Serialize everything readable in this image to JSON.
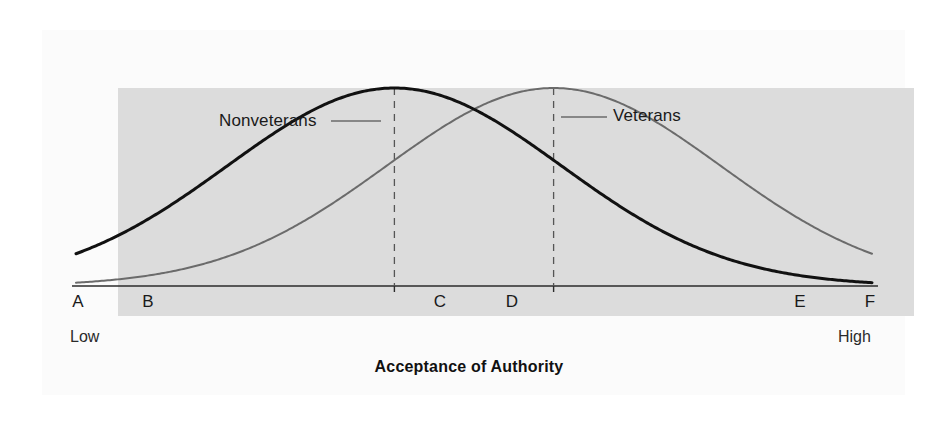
{
  "figure": {
    "axis_title": "Acceptance of Authority",
    "low_label": "Low",
    "high_label": "High",
    "background_color": "#fbfbfb",
    "plot_background_color": "#dcdcdc"
  },
  "labels": {
    "nonveterans": "Nonveterans",
    "veterans": "Veterans"
  },
  "ticks": {
    "a": "A",
    "b": "B",
    "c": "C",
    "d": "D",
    "e": "E",
    "f": "F"
  },
  "chart_data": {
    "type": "line",
    "title": "",
    "xlabel": "Acceptance of Authority",
    "ylabel": "",
    "grid": false,
    "legend_position": "inline-annotation",
    "x_tick_labels": [
      "A",
      "B",
      "C",
      "D",
      "E",
      "F"
    ],
    "x_tick_positions": [
      0,
      1,
      2,
      3,
      4,
      5
    ],
    "x_axis_low_end_label": "Low",
    "x_axis_high_end_label": "High",
    "annotations": [
      {
        "text": "Nonveterans",
        "points_to_series": "Nonveterans"
      },
      {
        "text": "Veterans",
        "points_to_series": "Veterans"
      },
      {
        "type": "dashed-vertical-line",
        "at_tick": "C",
        "marks": "peak of Nonveterans"
      },
      {
        "type": "dashed-vertical-line",
        "at_tick": "D",
        "marks": "peak of Veterans"
      }
    ],
    "series": [
      {
        "name": "Nonveterans",
        "color": "#111111",
        "line_width": 3,
        "distribution": "normal",
        "peak_tick": "C",
        "peak_x": 2.0,
        "sigma_in_ticks": 1.05,
        "peak_height_relative": 1.0,
        "x": [
          0,
          0.5,
          1,
          1.5,
          2,
          2.5,
          3,
          3.5,
          4,
          4.5,
          5
        ],
        "values": [
          0.14,
          0.32,
          0.57,
          0.85,
          1.0,
          0.85,
          0.57,
          0.32,
          0.14,
          0.05,
          0.01
        ]
      },
      {
        "name": "Veterans",
        "color": "#6b6b6b",
        "line_width": 2,
        "distribution": "normal",
        "peak_tick": "D",
        "peak_x": 3.0,
        "sigma_in_ticks": 1.05,
        "peak_height_relative": 1.0,
        "x": [
          0,
          0.5,
          1,
          1.5,
          2,
          2.5,
          3,
          3.5,
          4,
          4.5,
          5
        ],
        "values": [
          0.01,
          0.05,
          0.14,
          0.32,
          0.57,
          0.85,
          1.0,
          0.85,
          0.57,
          0.32,
          0.14
        ]
      }
    ]
  }
}
